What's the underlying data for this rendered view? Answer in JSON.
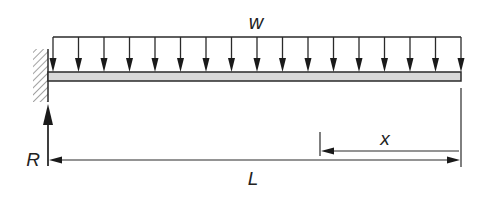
{
  "diagram": {
    "type": "cantilever-beam-uniform-load",
    "labels": {
      "load": "w",
      "reaction": "R",
      "length": "L",
      "distance": "x"
    },
    "load": {
      "arrow_count": 17,
      "distribution": "uniform"
    },
    "colors": {
      "line": "#2a2a2a",
      "beam_fill": "#d9d9d9",
      "hatch": "#8a8a8a"
    }
  }
}
